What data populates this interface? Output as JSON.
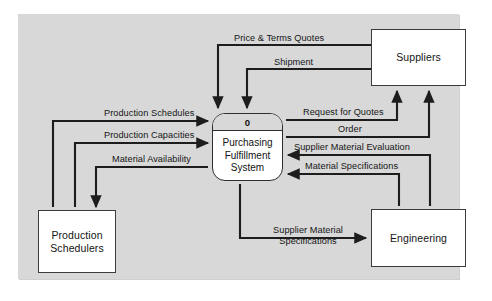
{
  "diagram": {
    "type": "context-data-flow-diagram",
    "process": {
      "id": "0",
      "name": "Purchasing Fulfillment System"
    },
    "external_entities": [
      {
        "key": "suppliers",
        "label": "Suppliers"
      },
      {
        "key": "engineering",
        "label": "Engineering"
      },
      {
        "key": "production_schedulers",
        "label": "Production Schedulers"
      }
    ],
    "flows": [
      {
        "key": "price_terms_quotes",
        "label": "Price & Terms Quotes",
        "from": "suppliers",
        "to": "process"
      },
      {
        "key": "shipment",
        "label": "Shipment",
        "from": "suppliers",
        "to": "process"
      },
      {
        "key": "request_for_quotes",
        "label": "Request for Quotes",
        "from": "process",
        "to": "suppliers"
      },
      {
        "key": "order",
        "label": "Order",
        "from": "process",
        "to": "suppliers"
      },
      {
        "key": "supplier_material_evaluation",
        "label": "Supplier Material Evaluation",
        "from": "engineering",
        "to": "process"
      },
      {
        "key": "material_specifications",
        "label": "Material Specifications",
        "from": "engineering",
        "to": "process"
      },
      {
        "key": "supplier_material_specifications",
        "label": "Supplier Material Specifications",
        "from": "process",
        "to": "engineering"
      },
      {
        "key": "production_schedules",
        "label": "Production Schedules",
        "from": "production_schedulers",
        "to": "process"
      },
      {
        "key": "production_capacities",
        "label": "Production Capacities",
        "from": "production_schedulers",
        "to": "process"
      },
      {
        "key": "material_availability",
        "label": "Material Availability",
        "from": "process",
        "to": "production_schedulers"
      }
    ],
    "colors": {
      "panel_background": "#d8d8d8",
      "page_background": "#ffffff",
      "box_fill": "#ffffff",
      "stroke": "#2e2e2e",
      "text": "#141414"
    }
  }
}
